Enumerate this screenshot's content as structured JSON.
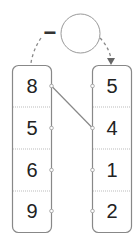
{
  "diagram": {
    "operator": "−",
    "left_column": [
      "8",
      "5",
      "6",
      "9"
    ],
    "right_column": [
      "5",
      "4",
      "1",
      "2"
    ],
    "connection": {
      "from": "left-0",
      "to": "right-1"
    },
    "colors": {
      "stroke": "#888888",
      "text": "#222222"
    }
  }
}
